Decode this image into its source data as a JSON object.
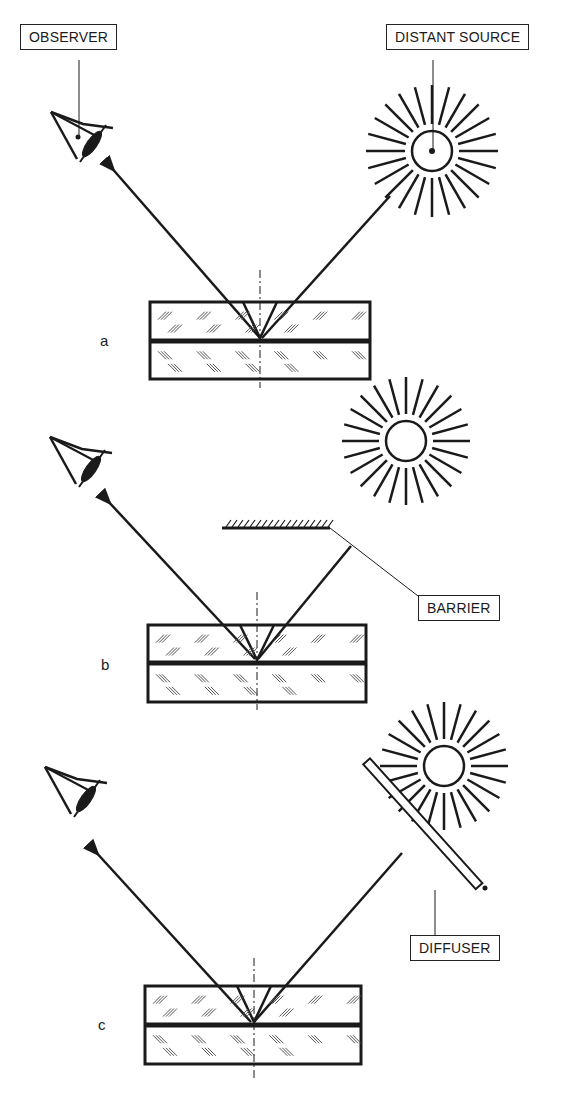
{
  "labels": {
    "observer": "OBSERVER",
    "distant_source": "DISTANT SOURCE",
    "barrier": "BARRIER",
    "diffuser": "DIFFUSER"
  },
  "panels": [
    {
      "letter": "a",
      "description": "Direct distant source reflected off laminated glass to observer"
    },
    {
      "letter": "b",
      "description": "Barrier blocks direct source; reflected ray reaches observer"
    },
    {
      "letter": "c",
      "description": "Diffuser between source and glass; reflected ray reaches observer"
    }
  ],
  "colors": {
    "ink": "#1a1a1a",
    "background": "#ffffff"
  }
}
